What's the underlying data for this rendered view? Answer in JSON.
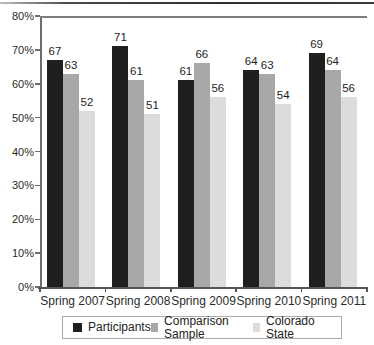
{
  "figure": {
    "top_rule_color": "#3a3a3a",
    "background": "#ffffff",
    "axis_color": "#6e6e6e"
  },
  "chart_data": {
    "type": "bar",
    "title": "",
    "xlabel": "",
    "ylabel": "",
    "categories": [
      "Spring 2007",
      "Spring 2008",
      "Spring 2009",
      "Spring 2010",
      "Spring 2011"
    ],
    "series": [
      {
        "name": "Participants",
        "color": "#1f1f1f",
        "values": [
          67,
          71,
          61,
          64,
          69
        ]
      },
      {
        "name": "Comparison Sample",
        "color": "#a8a8a8",
        "values": [
          63,
          61,
          66,
          63,
          64
        ]
      },
      {
        "name": "Colorado State",
        "color": "#dcdcdc",
        "values": [
          52,
          51,
          56,
          54,
          56
        ]
      }
    ],
    "ylim": [
      0,
      80
    ],
    "ytick_step": 10,
    "ytick_labels": [
      "0%",
      "10%",
      "20%",
      "30%",
      "40%",
      "50%",
      "60%",
      "70%",
      "80%"
    ],
    "grid": false,
    "value_labels": true,
    "legend_position": "bottom"
  }
}
